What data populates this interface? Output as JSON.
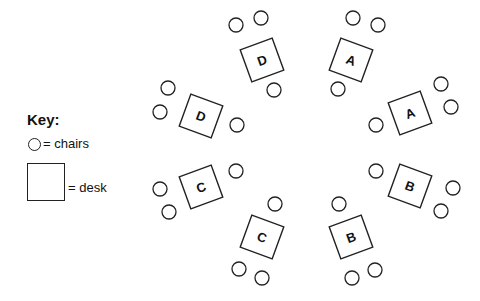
{
  "key": {
    "title": "Key:",
    "chair_label": "= chairs",
    "desk_label": "= desk"
  },
  "colors": {
    "stroke": "#222222",
    "background": "#ffffff",
    "text": "#111111"
  },
  "desks": [
    {
      "label": "D",
      "cx": 262,
      "cy": 60,
      "rotate": -20,
      "chairs": [
        [
          236,
          25
        ],
        [
          261,
          18
        ],
        [
          274,
          90
        ]
      ]
    },
    {
      "label": "A",
      "cx": 351,
      "cy": 60,
      "rotate": 20,
      "chairs": [
        [
          353,
          18
        ],
        [
          378,
          25
        ],
        [
          338,
          89
        ]
      ]
    },
    {
      "label": "D",
      "cx": 201,
      "cy": 116,
      "rotate": 20,
      "chairs": [
        [
          168,
          88
        ],
        [
          160,
          112
        ],
        [
          237,
          125
        ]
      ]
    },
    {
      "label": "A",
      "cx": 410,
      "cy": 113,
      "rotate": -20,
      "chairs": [
        [
          441,
          84
        ],
        [
          451,
          107
        ],
        [
          376,
          125
        ]
      ]
    },
    {
      "label": "C",
      "cx": 201,
      "cy": 187,
      "rotate": -20,
      "chairs": [
        [
          236,
          171
        ],
        [
          160,
          189
        ],
        [
          169,
          212
        ]
      ]
    },
    {
      "label": "B",
      "cx": 410,
      "cy": 186,
      "rotate": 20,
      "chairs": [
        [
          376,
          171
        ],
        [
          453,
          188
        ],
        [
          441,
          211
        ]
      ]
    },
    {
      "label": "C",
      "cx": 262,
      "cy": 237,
      "rotate": 20,
      "chairs": [
        [
          275,
          204
        ],
        [
          239,
          269
        ],
        [
          262,
          278
        ]
      ]
    },
    {
      "label": "B",
      "cx": 351,
      "cy": 237,
      "rotate": -20,
      "chairs": [
        [
          339,
          204
        ],
        [
          352,
          278
        ],
        [
          375,
          270
        ]
      ]
    }
  ],
  "desk_size": 34,
  "chair_radius": 7
}
